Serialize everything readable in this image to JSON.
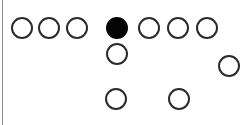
{
  "figure": {
    "width": 250,
    "height": 125,
    "background_color": "#ffffff",
    "stroke_color": "#2b2b2b",
    "fill_color": "#050505",
    "stroke_width": 2,
    "rule": {
      "name": "left-vertical-rule",
      "color": "#8c8c8c",
      "x": 2,
      "y": 0,
      "width": 1,
      "height": 125
    }
  },
  "chart_data": {
    "type": "scatter",
    "title": "",
    "xlabel": "",
    "ylabel": "",
    "xlim": [
      0,
      250
    ],
    "ylim": [
      0,
      125
    ],
    "grid": false,
    "legend": null,
    "marker_diameter": 22,
    "rows": [
      {
        "row": 1,
        "cy": 28,
        "count": 7,
        "nodes": [
          {
            "id": "r1c1",
            "cx": 22,
            "cy": 28,
            "state": "empty",
            "d": 22
          },
          {
            "id": "r1c2",
            "cx": 49,
            "cy": 28,
            "state": "empty",
            "d": 22
          },
          {
            "id": "r1c3",
            "cx": 77,
            "cy": 28,
            "state": "empty",
            "d": 22
          },
          {
            "id": "r1c4",
            "cx": 117,
            "cy": 28,
            "state": "filled",
            "d": 22
          },
          {
            "id": "r1c5",
            "cx": 149,
            "cy": 28,
            "state": "empty",
            "d": 22
          },
          {
            "id": "r1c6",
            "cx": 178,
            "cy": 28,
            "state": "empty",
            "d": 22
          },
          {
            "id": "r1c7",
            "cx": 207,
            "cy": 28,
            "state": "empty",
            "d": 22
          }
        ]
      },
      {
        "row": 2,
        "cy": 54,
        "count": 2,
        "nodes": [
          {
            "id": "r2c1",
            "cx": 117,
            "cy": 54,
            "state": "empty",
            "d": 22
          },
          {
            "id": "r2c2",
            "cx": 229,
            "cy": 66,
            "state": "empty",
            "d": 22
          }
        ]
      },
      {
        "row": 3,
        "cy": 99,
        "count": 2,
        "nodes": [
          {
            "id": "r3c1",
            "cx": 116,
            "cy": 99,
            "state": "empty",
            "d": 22
          },
          {
            "id": "r3c2",
            "cx": 179,
            "cy": 99,
            "state": "empty",
            "d": 22
          }
        ]
      }
    ],
    "summary": {
      "total_nodes": 11,
      "filled_nodes": 1,
      "empty_nodes": 10
    }
  }
}
